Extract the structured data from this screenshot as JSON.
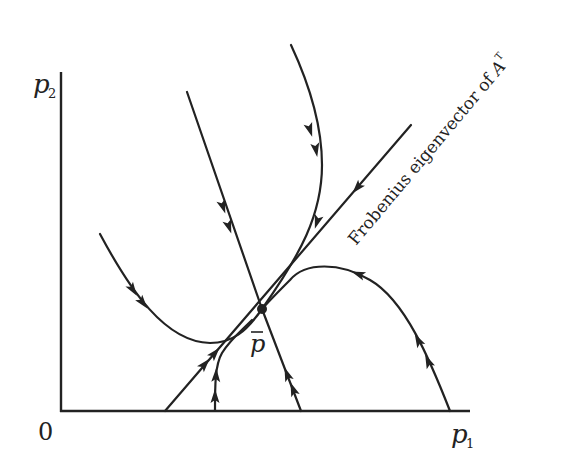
{
  "diagram": {
    "type": "phase-portrait",
    "axes": {
      "origin_label": "0",
      "x_label": "p",
      "x_label_subscript": "1",
      "y_label": "p",
      "y_label_subscript": "2"
    },
    "equilibrium": {
      "label": "p",
      "label_decoration": "bar",
      "position": [
        262,
        309
      ]
    },
    "eigenvector_line": {
      "label_text": "Frobenius eigenvector of ",
      "label_symbol": "A",
      "label_superscript": "T",
      "from": [
        165,
        411
      ],
      "to": [
        411,
        125
      ]
    },
    "trajectories": [
      {
        "name": "eigenvector-line",
        "direction": "toward-equilibrium",
        "arrows": 3
      },
      {
        "name": "straight-from-top-left",
        "direction": "toward-equilibrium",
        "arrows": 2
      },
      {
        "name": "straight-from-bottom",
        "direction": "toward-equilibrium",
        "arrows": 2
      },
      {
        "name": "curve-from-left",
        "direction": "toward-equilibrium",
        "arrows": 2
      },
      {
        "name": "curve-from-top",
        "direction": "toward-equilibrium",
        "arrows": 3
      },
      {
        "name": "arc-from-bottom-right",
        "direction": "toward-equilibrium",
        "arrows": 3
      },
      {
        "name": "vertical-from-bottom",
        "direction": "toward-equilibrium",
        "arrows": 2
      }
    ],
    "colors": {
      "ink": "#222222",
      "background": "#ffffff"
    }
  }
}
